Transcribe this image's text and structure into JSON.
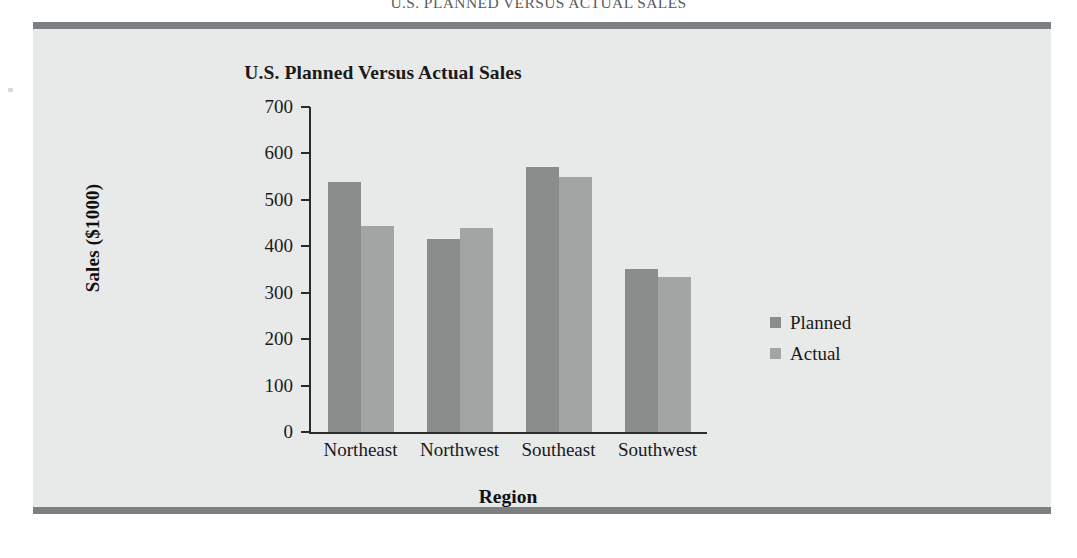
{
  "page_header": "U.S. PLANNED VERSUS ACTUAL SALES",
  "chart_data": {
    "type": "bar",
    "title": "U.S. Planned Versus Actual Sales",
    "xlabel": "Region",
    "ylabel": "Sales ($1000)",
    "categories": [
      "Northeast",
      "Northwest",
      "Southeast",
      "Southwest"
    ],
    "series": [
      {
        "name": "Planned",
        "color": "#8b8c8c",
        "values": [
          538,
          416,
          571,
          351
        ]
      },
      {
        "name": "Actual",
        "color": "#a3a4a4",
        "values": [
          444,
          440,
          550,
          334
        ]
      }
    ],
    "ylim": [
      0,
      700
    ],
    "yticks": [
      0,
      100,
      200,
      300,
      400,
      500,
      600,
      700
    ],
    "ytick_labels": [
      "0",
      "100",
      "200",
      "300",
      "400",
      "500",
      "600",
      "700"
    ],
    "grid": false,
    "legend_position": "right"
  },
  "colors": {
    "frame_band": "#7c8082",
    "figure_background": "#e8e9e9",
    "axis": "#2b2b2b",
    "text": "#1a1a1a"
  }
}
